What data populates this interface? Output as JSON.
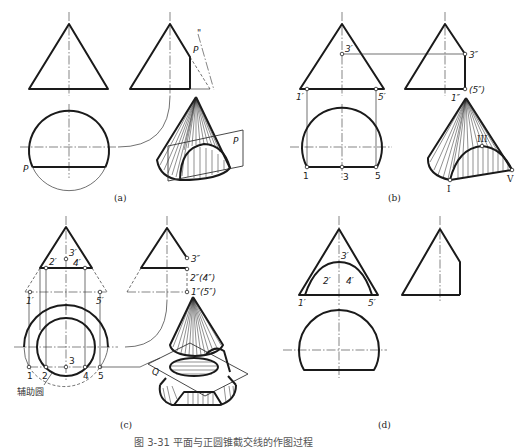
{
  "figure": {
    "caption": "图 3-31  平面与正圆锥截交线的作图过程",
    "panels": [
      {
        "id": "a",
        "label": "(a)",
        "labels": {
          "plane_side": "P",
          "plane_top": "P",
          "plane_3d": "P",
          "double_prime": "\""
        }
      },
      {
        "id": "b",
        "label": "(b)",
        "labels": {
          "p3_front": "3′",
          "p1_front": "1′",
          "p5_front": "5′",
          "p3_side": "3″",
          "p15_side": "(5″)",
          "p1_side": "1″",
          "p1_top": "1",
          "p3_top": "3",
          "p5_top": "5",
          "roman_III": "III",
          "roman_I": "I",
          "roman_V": "V"
        }
      },
      {
        "id": "c",
        "label": "(c)",
        "labels": {
          "p3_front": "3′",
          "p2_front": "2′",
          "p4_front": "4′",
          "p1_front": "1′",
          "p5_front": "5′",
          "p3_side": "3″",
          "p24_side": "2″(4″)",
          "p15_side": "1″(5″)",
          "p1_top": "1",
          "p2_top": "2",
          "p3_top": "3",
          "p4_top": "4",
          "p5_top": "5",
          "aux_circle": "辅助圆",
          "plane_3d": "Q"
        }
      },
      {
        "id": "d",
        "label": "(d)",
        "labels": {
          "p3_front": "3′",
          "p2_front": "2′",
          "p4_front": "4′",
          "p1_front": "1′",
          "p5_front": "5′"
        }
      }
    ]
  }
}
